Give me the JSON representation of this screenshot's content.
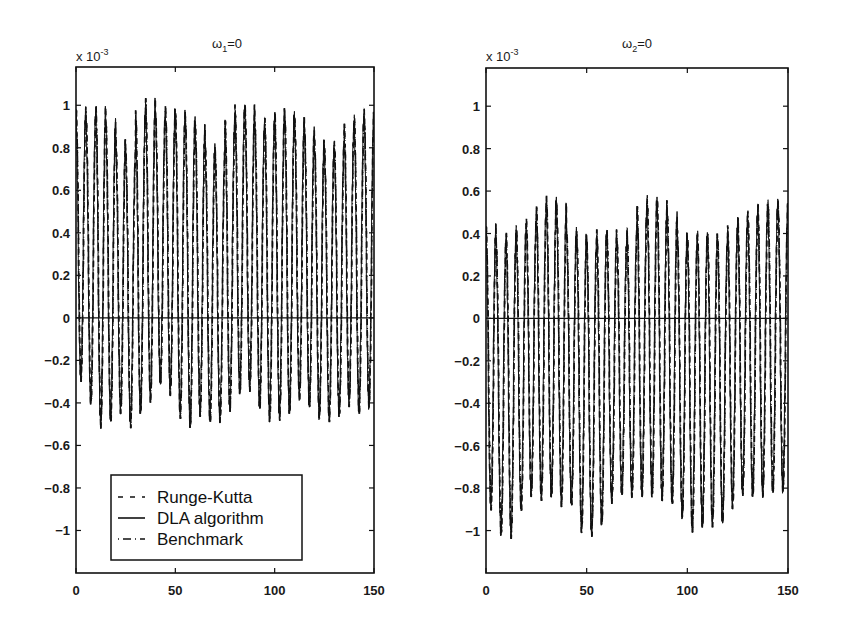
{
  "figure": {
    "background": "#ffffff",
    "ink": "#111111"
  },
  "chart_data": [
    {
      "type": "line",
      "title": "ω1=0",
      "title_parts": {
        "symbol": "ω",
        "subscript": "1",
        "rest": "=0"
      },
      "multiplier_label": "x 10",
      "multiplier_exponent": "-3",
      "xlabel": "",
      "ylabel": "",
      "xlim": [
        0,
        150
      ],
      "ylim": [
        -1.2,
        1.18
      ],
      "xticks": [
        0,
        50,
        100,
        150
      ],
      "xtick_labels": [
        "0",
        "50",
        "100",
        "150"
      ],
      "yticks": [
        1,
        0.8,
        0.6,
        0.4,
        0.2,
        0,
        -0.2,
        -0.4,
        -0.6,
        -0.8,
        -1
      ],
      "ytick_labels": [
        "1",
        "0.8",
        "0.6",
        "0.4",
        "0.2",
        "0",
        "-0.2",
        "-0.4",
        "-0.6",
        "-0.8",
        "-1"
      ],
      "grid": false,
      "zero_line": true,
      "legend": {
        "position": "lower left",
        "entries": [
          {
            "label": "Runge-Kutta",
            "style": "dashed"
          },
          {
            "label": "DLA algorithm",
            "style": "solid"
          },
          {
            "label": "Benchmark",
            "style": "dashdot"
          }
        ]
      },
      "series": [
        {
          "name": "Runge-Kutta",
          "style": "dashed",
          "description": "rapid oscillation, approx. 30 cycles over 0-150, centered near +0.25e-3"
        },
        {
          "name": "DLA algorithm",
          "style": "solid",
          "description": "overlaps Runge-Kutta closely"
        },
        {
          "name": "Benchmark",
          "style": "dashdot",
          "description": "overlaps Runge-Kutta closely"
        }
      ],
      "oscillation": {
        "cycles": 30,
        "center": 0.25,
        "peaks": [
          1.12,
          1.11,
          1.15,
          1.08,
          0.98,
          0.92,
          1.12,
          1.18,
          1.1,
          1.13,
          1.12,
          1.1,
          1.05,
          0.95,
          0.92,
          1.08,
          1.14,
          1.14,
          1.06,
          1.08,
          1.13,
          1.12,
          1.08,
          1.03,
          0.98,
          0.94,
          0.96,
          1.05,
          1.1,
          1.12
        ],
        "troughs": [
          -0.43,
          -0.55,
          -0.67,
          -0.64,
          -0.58,
          -0.65,
          -0.6,
          -0.54,
          -0.45,
          -0.5,
          -0.62,
          -0.67,
          -0.6,
          -0.63,
          -0.62,
          -0.58,
          -0.5,
          -0.48,
          -0.57,
          -0.63,
          -0.63,
          -0.6,
          -0.52,
          -0.56,
          -0.61,
          -0.62,
          -0.6,
          -0.55,
          -0.6,
          -0.57
        ]
      },
      "approx_range": {
        "max": 1.18,
        "min": -0.67
      }
    },
    {
      "type": "line",
      "title": "ω2=0",
      "title_parts": {
        "symbol": "ω",
        "subscript": "2",
        "rest": "=0"
      },
      "multiplier_label": "x 10",
      "multiplier_exponent": "-3",
      "xlabel": "",
      "ylabel": "",
      "xlim": [
        0,
        150
      ],
      "ylim": [
        -1.2,
        1.18
      ],
      "xticks": [
        0,
        50,
        100,
        150
      ],
      "xtick_labels": [
        "0",
        "50",
        "100",
        "150"
      ],
      "yticks": [
        1,
        0.8,
        0.6,
        0.4,
        0.2,
        0,
        -0.2,
        -0.4,
        -0.6,
        -0.8,
        -1
      ],
      "ytick_labels": [
        "1",
        "0.8",
        "0.6",
        "0.4",
        "0.2",
        "0",
        "-0.2",
        "-0.4",
        "-0.6",
        "-0.8",
        "-1"
      ],
      "grid": false,
      "zero_line": true,
      "series": [
        {
          "name": "Runge-Kutta",
          "style": "dashed",
          "description": "rapid oscillation, approx. 30 cycles over 0-150, centered near -0.25e-3"
        },
        {
          "name": "DLA algorithm",
          "style": "solid",
          "description": "overlaps Runge-Kutta closely"
        },
        {
          "name": "Benchmark",
          "style": "dashdot",
          "description": "overlaps Runge-Kutta closely"
        }
      ],
      "oscillation": {
        "cycles": 30,
        "center": -0.25,
        "peaks": [
          0.58,
          0.52,
          0.55,
          0.58,
          0.6,
          0.68,
          0.72,
          0.69,
          0.56,
          0.55,
          0.52,
          0.56,
          0.55,
          0.5,
          0.55,
          0.68,
          0.72,
          0.7,
          0.64,
          0.55,
          0.53,
          0.55,
          0.54,
          0.52,
          0.57,
          0.62,
          0.64,
          0.68,
          0.7,
          0.69
        ],
        "troughs": [
          -1.04,
          -1.17,
          -1.18,
          -1.05,
          -0.97,
          -1.0,
          -0.99,
          -1.03,
          -1.02,
          -1.15,
          -1.17,
          -1.12,
          -1.0,
          -0.96,
          -0.97,
          -0.98,
          -0.99,
          -1.0,
          -1.02,
          -1.08,
          -1.15,
          -1.13,
          -1.12,
          -1.11,
          -1.03,
          -0.97,
          -0.98,
          -0.98,
          -0.97,
          -0.96
        ]
      },
      "approx_range": {
        "max": 0.72,
        "min": -1.18
      }
    }
  ]
}
